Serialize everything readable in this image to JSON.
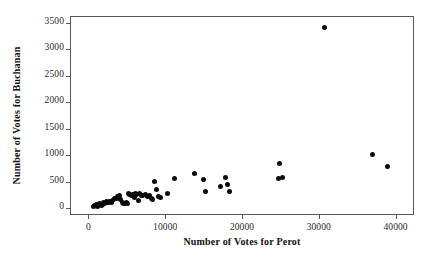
{
  "chart_data": {
    "type": "scatter",
    "title": "",
    "xlabel": "Number of Votes for Perot",
    "ylabel": "Number of Votes for Buchanan",
    "xlim": [
      -2400,
      42400
    ],
    "ylim": [
      -130,
      3630
    ],
    "xticks": [
      0,
      10000,
      20000,
      30000,
      40000
    ],
    "xticklabels": [
      "0",
      "10000",
      "20000",
      "30000",
      "40000"
    ],
    "yticks": [
      0,
      500,
      1000,
      1500,
      2000,
      2500,
      3000,
      3500
    ],
    "yticklabels": [
      "0",
      "500",
      "1000",
      "1500",
      "2000",
      "2500",
      "3000",
      "3500"
    ],
    "grid": false,
    "legend": false,
    "marker": "filled-circle",
    "marker_color": "#0a0a0a",
    "frame_color": "#585858",
    "background": "#ffffff",
    "points": [
      {
        "x": 620,
        "y": 30
      },
      {
        "x": 790,
        "y": 45
      },
      {
        "x": 1010,
        "y": 60
      },
      {
        "x": 1160,
        "y": 35
      },
      {
        "x": 1360,
        "y": 70
      },
      {
        "x": 1500,
        "y": 90
      },
      {
        "x": 1700,
        "y": 55
      },
      {
        "x": 1830,
        "y": 75
      },
      {
        "x": 1980,
        "y": 105
      },
      {
        "x": 2150,
        "y": 85
      },
      {
        "x": 2300,
        "y": 120
      },
      {
        "x": 2480,
        "y": 100
      },
      {
        "x": 2600,
        "y": 115
      },
      {
        "x": 2780,
        "y": 125
      },
      {
        "x": 2950,
        "y": 105
      },
      {
        "x": 3100,
        "y": 135
      },
      {
        "x": 3400,
        "y": 175
      },
      {
        "x": 3600,
        "y": 190
      },
      {
        "x": 3800,
        "y": 215
      },
      {
        "x": 4050,
        "y": 245
      },
      {
        "x": 4200,
        "y": 160
      },
      {
        "x": 4400,
        "y": 105
      },
      {
        "x": 4600,
        "y": 95
      },
      {
        "x": 4750,
        "y": 80
      },
      {
        "x": 4900,
        "y": 105
      },
      {
        "x": 5050,
        "y": 90
      },
      {
        "x": 5200,
        "y": 270
      },
      {
        "x": 5400,
        "y": 250
      },
      {
        "x": 5600,
        "y": 230
      },
      {
        "x": 5800,
        "y": 265
      },
      {
        "x": 5950,
        "y": 195
      },
      {
        "x": 6100,
        "y": 285
      },
      {
        "x": 6300,
        "y": 255
      },
      {
        "x": 6500,
        "y": 140
      },
      {
        "x": 6700,
        "y": 270
      },
      {
        "x": 6900,
        "y": 245
      },
      {
        "x": 7100,
        "y": 230
      },
      {
        "x": 7400,
        "y": 260
      },
      {
        "x": 7700,
        "y": 215
      },
      {
        "x": 7900,
        "y": 240
      },
      {
        "x": 8200,
        "y": 190
      },
      {
        "x": 8400,
        "y": 165
      },
      {
        "x": 8600,
        "y": 500
      },
      {
        "x": 8800,
        "y": 345
      },
      {
        "x": 9100,
        "y": 225
      },
      {
        "x": 9400,
        "y": 195
      },
      {
        "x": 10300,
        "y": 285
      },
      {
        "x": 11200,
        "y": 560
      },
      {
        "x": 13800,
        "y": 660
      },
      {
        "x": 15000,
        "y": 535
      },
      {
        "x": 15200,
        "y": 320
      },
      {
        "x": 17200,
        "y": 410
      },
      {
        "x": 17900,
        "y": 580
      },
      {
        "x": 18100,
        "y": 445
      },
      {
        "x": 18400,
        "y": 315
      },
      {
        "x": 24900,
        "y": 850
      },
      {
        "x": 24700,
        "y": 565
      },
      {
        "x": 25300,
        "y": 575
      },
      {
        "x": 30700,
        "y": 3410
      },
      {
        "x": 37000,
        "y": 1010
      },
      {
        "x": 38900,
        "y": 790
      }
    ]
  }
}
